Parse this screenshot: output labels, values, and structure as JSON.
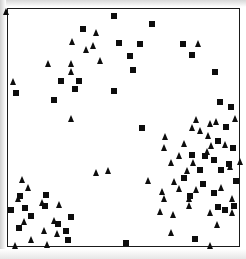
{
  "figure": {
    "title": "",
    "background_color": "#ffffff",
    "frame_color": "#1a1a1a",
    "marker_color": "#0d0d0d"
  },
  "chart_data": {
    "type": "scatter",
    "title": "",
    "xlabel": "",
    "ylabel": "",
    "xlim": [
      0,
      100
    ],
    "ylim": [
      0,
      100
    ],
    "grid": false,
    "legend": "none",
    "axis_ticks": "none",
    "frame": {
      "left_px": 7,
      "top_px": 8,
      "width_px": 233,
      "height_px": 239
    },
    "marker_size_px": 6,
    "series": [
      {
        "name": "squares",
        "marker": "square",
        "color": "#0d0d0d",
        "count": 49,
        "points_px": [
          [
            83,
            29
          ],
          [
            114,
            16
          ],
          [
            152,
            24
          ],
          [
            183,
            44
          ],
          [
            140,
            44
          ],
          [
            192,
            55
          ],
          [
            119,
            43
          ],
          [
            130,
            56
          ],
          [
            133,
            70
          ],
          [
            61,
            81
          ],
          [
            79,
            81
          ],
          [
            75,
            89
          ],
          [
            114,
            91
          ],
          [
            16,
            93
          ],
          [
            54,
            100
          ],
          [
            215,
            72
          ],
          [
            220,
            102
          ],
          [
            231,
            107
          ],
          [
            142,
            128
          ],
          [
            226,
            127
          ],
          [
            218,
            141
          ],
          [
            192,
            155
          ],
          [
            205,
            156
          ],
          [
            214,
            160
          ],
          [
            233,
            148
          ],
          [
            200,
            170
          ],
          [
            221,
            170
          ],
          [
            229,
            164
          ],
          [
            184,
            178
          ],
          [
            236,
            181
          ],
          [
            203,
            184
          ],
          [
            214,
            193
          ],
          [
            190,
            196
          ],
          [
            234,
            206
          ],
          [
            218,
            207
          ],
          [
            225,
            210
          ],
          [
            11,
            210
          ],
          [
            25,
            208
          ],
          [
            45,
            206
          ],
          [
            31,
            216
          ],
          [
            19,
            228
          ],
          [
            20,
            196
          ],
          [
            46,
            195
          ],
          [
            58,
            224
          ],
          [
            66,
            231
          ],
          [
            71,
            217
          ],
          [
            68,
            240
          ],
          [
            126,
            243
          ],
          [
            195,
            239
          ]
        ]
      },
      {
        "name": "triangles",
        "marker": "triangle",
        "color": "#0d0d0d",
        "count": 62,
        "points_px": [
          [
            6,
            12
          ],
          [
            96,
            33
          ],
          [
            72,
            42
          ],
          [
            93,
            46
          ],
          [
            86,
            50
          ],
          [
            48,
            64
          ],
          [
            71,
            64
          ],
          [
            100,
            61
          ],
          [
            71,
            72
          ],
          [
            13,
            82
          ],
          [
            71,
            119
          ],
          [
            198,
            44
          ],
          [
            210,
            124
          ],
          [
            192,
            128
          ],
          [
            216,
            122
          ],
          [
            165,
            137
          ],
          [
            208,
            136
          ],
          [
            164,
            148
          ],
          [
            179,
            156
          ],
          [
            207,
            152
          ],
          [
            211,
            146
          ],
          [
            225,
            145
          ],
          [
            96,
            173
          ],
          [
            108,
            171
          ],
          [
            171,
            163
          ],
          [
            193,
            163
          ],
          [
            174,
            182
          ],
          [
            179,
            189
          ],
          [
            196,
            190
          ],
          [
            221,
            188
          ],
          [
            162,
            192
          ],
          [
            164,
            199
          ],
          [
            189,
            199
          ],
          [
            232,
            199
          ],
          [
            230,
            167
          ],
          [
            240,
            162
          ],
          [
            160,
            212
          ],
          [
            189,
            206
          ],
          [
            210,
            213
          ],
          [
            171,
            233
          ],
          [
            22,
            180
          ],
          [
            28,
            188
          ],
          [
            18,
            199
          ],
          [
            42,
            203
          ],
          [
            59,
            205
          ],
          [
            24,
            222
          ],
          [
            54,
            221
          ],
          [
            57,
            234
          ],
          [
            15,
            246
          ],
          [
            47,
            245
          ],
          [
            210,
            246
          ],
          [
            200,
            131
          ],
          [
            184,
            144
          ],
          [
            232,
            213
          ],
          [
            217,
            225
          ],
          [
            173,
            215
          ],
          [
            148,
            181
          ],
          [
            235,
            119
          ],
          [
            196,
            120
          ],
          [
            187,
            171
          ],
          [
            44,
            231
          ],
          [
            31,
            240
          ]
        ]
      }
    ]
  }
}
